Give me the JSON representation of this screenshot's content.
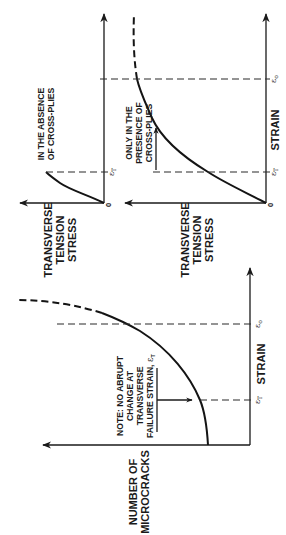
{
  "figure": {
    "orientation": "rotated 90 degrees counter-clockwise",
    "panels": [
      {
        "id": "absence",
        "y_axis_label_lines": [
          "TRANSVERSE",
          "TENSION",
          "STRESS"
        ],
        "x_axis_label": "",
        "origin_label": "0",
        "annotation_lines": [
          "IN THE ABSENCE",
          "OF CROSS-PLIES"
        ],
        "markers": [
          {
            "symbol": "ε",
            "subscript": "T"
          }
        ]
      },
      {
        "id": "presence",
        "y_axis_label_lines": [
          "TRANSVERSE",
          "TENSION",
          "STRESS"
        ],
        "x_axis_label": "STRAIN",
        "origin_label": "0",
        "annotation_lines": [
          "ONLY IN THE",
          "PRESENCE OF",
          "CROSS-PLIES"
        ],
        "markers": [
          {
            "symbol": "ε",
            "subscript": "T"
          },
          {
            "symbol": "ε",
            "subscript": "o"
          }
        ]
      },
      {
        "id": "microcracks",
        "y_axis_label_lines": [
          "NUMBER OF",
          "MICROCRACKS"
        ],
        "x_axis_label": "STRAIN",
        "annotation_lines": [
          "NOTE: NO ABRUPT",
          "CHANGE AT",
          "TRANSVERSE",
          "FAILURE STRAIN, "
        ],
        "annotation_symbol": "ε",
        "annotation_subscript": "T",
        "markers": [
          {
            "symbol": "ε",
            "subscript": "T"
          },
          {
            "symbol": "ε",
            "subscript": "o"
          }
        ]
      }
    ]
  }
}
